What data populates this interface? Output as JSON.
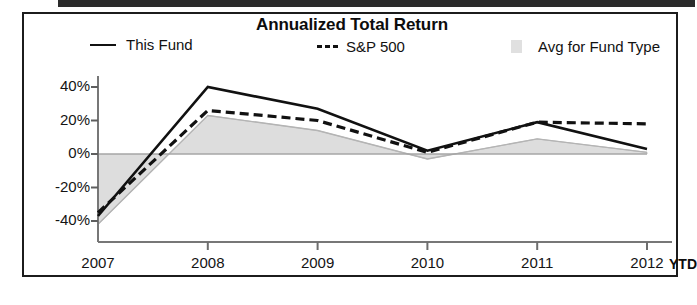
{
  "chart_data": {
    "type": "line",
    "title": "Annualized Total Return",
    "xlabel": "",
    "ylabel": "",
    "x_unit_note": "YTD",
    "categories": [
      "2007",
      "2008",
      "2009",
      "2010",
      "2011",
      "2012"
    ],
    "ylim": [
      -48,
      48
    ],
    "yticks": [
      -40,
      -20,
      0,
      20,
      40
    ],
    "ytick_labels": [
      "-40%",
      "-20%",
      "0%",
      "20%",
      "40%"
    ],
    "grid": false,
    "legend_position": "top",
    "series": [
      {
        "name": "This Fund",
        "style": "solid",
        "color": "#111111",
        "values": [
          -37,
          40,
          27,
          2,
          19,
          3
        ]
      },
      {
        "name": "S&P 500",
        "style": "dashed",
        "color": "#111111",
        "values": [
          -35,
          26,
          20,
          1,
          19,
          18
        ]
      },
      {
        "name": "Avg for Fund Type",
        "style": "area",
        "color": "#d5d5d5",
        "values": [
          -42,
          23,
          14,
          -3,
          9,
          1
        ]
      }
    ]
  },
  "chart": {
    "title": "Annualized Total Return",
    "legend": [
      {
        "label": "This Fund",
        "marker": "solid-line-marker"
      },
      {
        "label": "S&P 500",
        "marker": "dashed-line-marker"
      },
      {
        "label": "Avg for Fund Type",
        "marker": "area-swatch-marker"
      }
    ],
    "y_axis": {
      "labels": [
        "40%",
        "20%",
        "0%",
        "-20%",
        "-40%"
      ]
    },
    "x_axis": {
      "labels": [
        "2007",
        "2008",
        "2009",
        "2010",
        "2011",
        "2012"
      ],
      "unit": "YTD"
    },
    "colors": {
      "line": "#111111",
      "area_fill": "#d5d5d5",
      "axis": "#6b6b6b",
      "frame": "#1c1c1c",
      "text": "#121212"
    }
  }
}
